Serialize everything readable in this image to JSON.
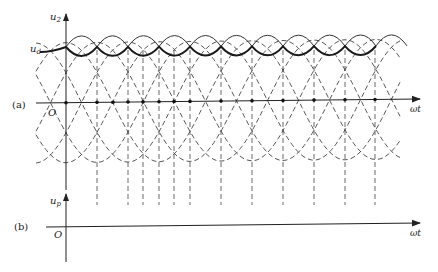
{
  "figure": {
    "panel_a": {
      "tag": "(a)",
      "y_axis_label": "u",
      "y_axis_sub": "2",
      "origin_label": "O",
      "x_axis_label": "ωt",
      "dc_label": "u",
      "dc_sub": "d",
      "phase_labels": [
        {
          "base": "u",
          "sub": "b",
          "prime": true
        },
        {
          "base": "u",
          "sub": "a",
          "prime": false
        },
        {
          "base": "u",
          "sub": "c",
          "prime": true
        },
        {
          "base": "u",
          "sub": "b",
          "prime": false
        },
        {
          "base": "u",
          "sub": "a",
          "prime": true
        },
        {
          "base": "u",
          "sub": "c",
          "prime": false
        },
        {
          "base": "u",
          "sub": "b",
          "prime": true
        },
        {
          "base": "u",
          "sub": "a",
          "prime": false
        }
      ],
      "time_markers": [
        {
          "label": "ωt",
          "sub": "1"
        },
        {
          "label": "ωt",
          "sub": "2"
        },
        {
          "label": "ωt",
          "sub": "3"
        },
        {
          "label": "ωt",
          "sub": "4"
        },
        {
          "label": "ωt",
          "sub": "5"
        },
        {
          "label": "ωt",
          "sub": "5"
        }
      ]
    },
    "panel_b": {
      "tag": "(b)",
      "y_axis_label": "u",
      "y_axis_sub": "p",
      "origin_label": "O",
      "x_axis_label": "ωt"
    },
    "colors": {
      "line": "#2a2a2a",
      "dashed": "#444444",
      "background": "#ffffff"
    }
  }
}
